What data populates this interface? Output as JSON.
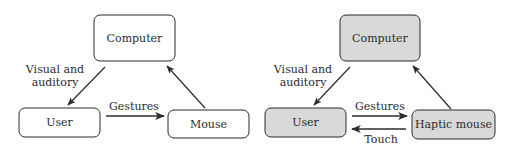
{
  "colors": {
    "stroke": "#2b2b2b",
    "plain_fill": "#ffffff",
    "haptic_fill": "#d9d9d9",
    "background": "#ffffff"
  },
  "diagrams": [
    {
      "id": "standard",
      "nodes": {
        "computer": "Computer",
        "user": "User",
        "device": "Mouse"
      },
      "edges": {
        "computer_to_user": "Visual and",
        "computer_to_user_line2": "auditory",
        "user_to_device": "Gestures"
      }
    },
    {
      "id": "haptic",
      "nodes": {
        "computer": "Computer",
        "user": "User",
        "device": "Haptic mouse"
      },
      "edges": {
        "computer_to_user": "Visual and",
        "computer_to_user_line2": "auditory",
        "user_to_device": "Gestures",
        "device_to_user": "Touch"
      }
    }
  ]
}
